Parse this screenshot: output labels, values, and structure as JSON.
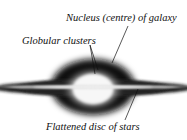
{
  "diagram": {
    "labels": {
      "nucleus": "Nucleus (centre) of galaxy",
      "globular": "Globular clusters",
      "disc": "Flattened disc of stars"
    },
    "colors": {
      "background": "#ffffff",
      "dark_halo": "#111111",
      "bright_core": "#f4f4f4",
      "text": "#111111"
    }
  }
}
